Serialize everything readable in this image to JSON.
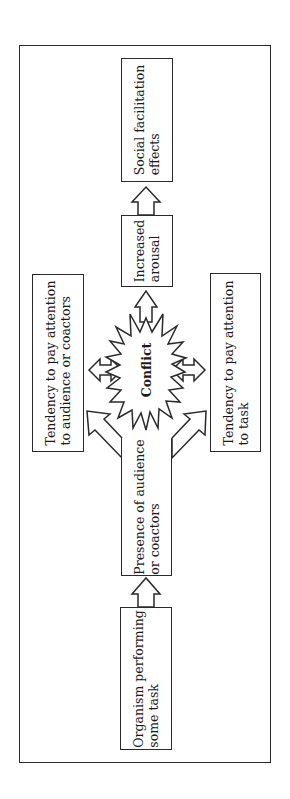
{
  "diagram": {
    "type": "flow",
    "orientation": "rotated-90-ccw",
    "nodes": {
      "organism": {
        "line1": "Organism performing",
        "line2": "some task"
      },
      "presence": {
        "line1": "Presence of audience",
        "line2": "or coactors"
      },
      "attention_audience": {
        "line1": "Tendency to pay attention",
        "line2": "to audience or coactors"
      },
      "attention_task": {
        "line1": "Tendency to pay attention",
        "line2": "to task"
      },
      "conflict": {
        "label": "Conflict"
      },
      "arousal": {
        "line1": "Increased",
        "line2": "arousal"
      },
      "social_facilitation": {
        "line1": "Social facilitation",
        "line2": "effects"
      }
    },
    "edges": [
      {
        "from": "organism",
        "to": "presence",
        "style": "block-arrow"
      },
      {
        "from": "presence",
        "to": "attention_audience",
        "style": "block-arrow"
      },
      {
        "from": "presence",
        "to": "attention_task",
        "style": "block-arrow"
      },
      {
        "from": "attention_audience",
        "to": "conflict",
        "style": "double-block-arrow"
      },
      {
        "from": "attention_task",
        "to": "conflict",
        "style": "double-block-arrow"
      },
      {
        "from": "conflict",
        "to": "arousal",
        "style": "block-arrow"
      },
      {
        "from": "arousal",
        "to": "social_facilitation",
        "style": "block-arrow"
      }
    ],
    "colors": {
      "stroke": "#2a2a2a",
      "fill": "#ffffff",
      "text": "#1a1a1a"
    }
  }
}
